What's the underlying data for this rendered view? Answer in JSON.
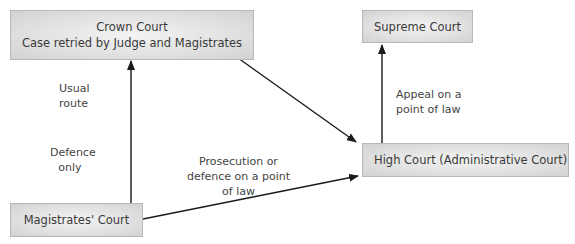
{
  "diagram": {
    "nodes": {
      "crown_court": {
        "title": "Crown Court",
        "subtitle": "Case retried by Judge and Magistrates"
      },
      "supreme_court": {
        "title": "Supreme Court"
      },
      "high_court": {
        "title": "High Court (Administrative Court)"
      },
      "magistrates_court": {
        "title": "Magistrates' Court"
      }
    },
    "edges": {
      "magistrates_to_crown": {
        "label_top": [
          "Usual",
          "route"
        ],
        "label_bottom": [
          "Defence",
          "only"
        ]
      },
      "crown_to_high": {
        "label": ""
      },
      "magistrates_to_high": {
        "label": [
          "Prosecution or",
          "defence on a point",
          "of law"
        ]
      },
      "high_to_supreme": {
        "label": [
          "Appeal on a",
          "point of law"
        ]
      }
    },
    "colors": {
      "box_fill": "#e2e2e2",
      "box_border": "#b8b8b8",
      "arrow": "#1a1a1a",
      "text": "#3a3a3a"
    }
  }
}
